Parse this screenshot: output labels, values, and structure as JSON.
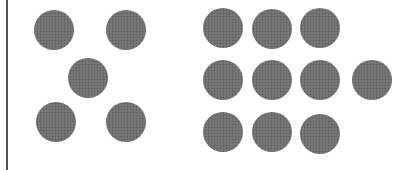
{
  "diagram": {
    "dot_color": "#6e6e6e",
    "dot_radius": 20,
    "groups": [
      {
        "name": "left-group",
        "count": 5,
        "dots": [
          [
            54,
            30
          ],
          [
            126,
            30
          ],
          [
            88,
            78
          ],
          [
            56,
            122
          ],
          [
            126,
            122
          ]
        ]
      },
      {
        "name": "right-group",
        "count": 11,
        "dots": [
          [
            223,
            28
          ],
          [
            272,
            29
          ],
          [
            320,
            28
          ],
          [
            223,
            80
          ],
          [
            272,
            80
          ],
          [
            320,
            80
          ],
          [
            372,
            80
          ],
          [
            223,
            132
          ],
          [
            272,
            132
          ],
          [
            320,
            134
          ]
        ]
      }
    ]
  }
}
